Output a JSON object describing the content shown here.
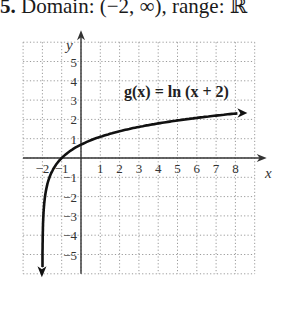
{
  "header": {
    "number": "5.",
    "text": "Domain: (−2, ∞), range: ℝ"
  },
  "chart_data": {
    "type": "line",
    "title": "g(x) = ln (x + 2)",
    "xlabel": "x",
    "ylabel": "y",
    "xlim": [
      -3,
      9
    ],
    "ylim": [
      -6,
      6
    ],
    "grid": true,
    "x_ticks": [
      "-2",
      "-1",
      "1",
      "2",
      "3",
      "4",
      "5",
      "6",
      "7",
      "8"
    ],
    "y_ticks": [
      "5",
      "4",
      "3",
      "2",
      "1",
      "-1",
      "-2",
      "-3",
      "-4",
      "-5"
    ],
    "series": [
      {
        "name": "g(x) = ln (x + 2)",
        "function": "ln(x+2)",
        "x": [
          -1.998,
          -1.99,
          -1.95,
          -1.9,
          -1.8,
          -1.6,
          -1.4,
          -1,
          -0.5,
          0,
          1,
          2,
          3,
          4,
          5,
          6,
          7,
          8
        ],
        "values": [
          -6.2,
          -4.61,
          -3.0,
          -2.3,
          -1.61,
          -0.92,
          -0.51,
          0,
          0.41,
          0.69,
          1.1,
          1.39,
          1.61,
          1.79,
          1.95,
          2.08,
          2.2,
          2.3
        ]
      }
    ],
    "annotations": [
      "arrow at left end (pointing down)",
      "arrow at right end"
    ]
  }
}
